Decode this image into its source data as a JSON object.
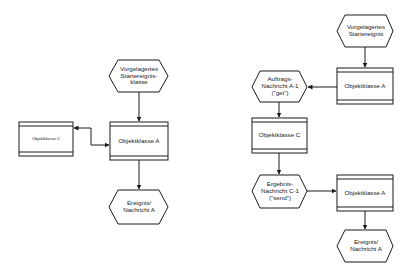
{
  "colors": {
    "stroke": "#1a1a1a",
    "background": "#ffffff",
    "text": "#222222"
  },
  "left_diagram": {
    "start_event": {
      "label": "Vorgelagertes\nStartereignis-\nklasse"
    },
    "class_a": {
      "label": "Objektklasse A"
    },
    "class_c": {
      "label": "Objektklasse C"
    },
    "end_event": {
      "label": "Ereignis/\nNachricht A"
    }
  },
  "right_diagram": {
    "start_event": {
      "label": "Vorgelagertes\nStartereignis"
    },
    "class_a_top": {
      "label": "Objektklasse A"
    },
    "request_message": {
      "label": "Auftrags-\nNachricht A-1\n(\"get\")"
    },
    "class_c": {
      "label": "Objektklasse C"
    },
    "result_message": {
      "label": "Ergebnis-\nNachricht C-1\n(\"send\")"
    },
    "class_a_bottom": {
      "label": "Objektklasse A"
    },
    "end_event": {
      "label": "Ereignis/\nNachricht A"
    }
  }
}
